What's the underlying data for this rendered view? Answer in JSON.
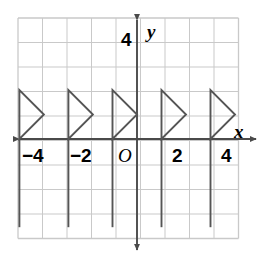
{
  "figure": {
    "type": "coordinate-grid-graph",
    "background": "#ffffff",
    "width": 265,
    "height": 271
  },
  "colors": {
    "grid_line": "#c9c9c9",
    "axis_line": "#4a4a4a",
    "shape_stroke": "#555555",
    "text": "#000000"
  },
  "grid": {
    "x_start_px": 18,
    "y_start_px": 18,
    "cell_px": 24.5,
    "cols": 9,
    "rows": 9,
    "visible": true
  },
  "axes": {
    "origin_px": {
      "x": 137,
      "y": 139
    },
    "unit_px": 24.5,
    "x_axis": {
      "label": "x",
      "label_pos_px": {
        "x": 234,
        "y": 122
      },
      "arrow_both_ends": true,
      "x_min_px": 19,
      "x_max_px": 256
    },
    "y_axis": {
      "label": "y",
      "label_pos_px": {
        "x": 147,
        "y": 22
      },
      "arrow_both_ends": true,
      "y_min_px": 20,
      "y_max_px": 250
    }
  },
  "tick_labels": [
    {
      "text": "−4",
      "axis": "x",
      "value": -4,
      "x_px": 22,
      "y_px": 146
    },
    {
      "text": "−2",
      "axis": "x",
      "value": -2,
      "x_px": 70,
      "y_px": 146
    },
    {
      "text": "O",
      "axis": "origin",
      "value": 0,
      "x_px": 118,
      "y_px": 146
    },
    {
      "text": "2",
      "axis": "x",
      "value": 2,
      "x_px": 172,
      "y_px": 146
    },
    {
      "text": "4",
      "axis": "x",
      "value": 4,
      "x_px": 221,
      "y_px": 146
    },
    {
      "text": "4",
      "axis": "y",
      "value": 4,
      "x_px": 121,
      "y_px": 30
    }
  ],
  "chart_data": {
    "type": "line",
    "title": "",
    "xlabel": "x",
    "ylabel": "y",
    "xlim": [
      -4.85,
      4.85
    ],
    "ylim": [
      -4.1,
      4.9
    ],
    "grid": true,
    "legend": null,
    "series": [
      {
        "name": "triangle-1",
        "vertices": [
          [
            -4.8,
            2
          ],
          [
            -4.8,
            0
          ],
          [
            -3.8,
            1
          ]
        ],
        "closed": true
      },
      {
        "name": "triangle-2",
        "vertices": [
          [
            -2.8,
            2
          ],
          [
            -2.8,
            0
          ],
          [
            -1.8,
            1
          ]
        ],
        "closed": true
      },
      {
        "name": "triangle-3",
        "vertices": [
          [
            -1.0,
            2
          ],
          [
            -1.0,
            0
          ],
          [
            0.0,
            1
          ]
        ],
        "closed": true
      },
      {
        "name": "triangle-4",
        "vertices": [
          [
            1.0,
            2
          ],
          [
            1.0,
            0
          ],
          [
            2.0,
            1
          ]
        ],
        "closed": true
      },
      {
        "name": "triangle-5",
        "vertices": [
          [
            3.0,
            2
          ],
          [
            3.0,
            0
          ],
          [
            4.0,
            1
          ]
        ],
        "closed": true
      }
    ],
    "vertical_extensions": [
      {
        "name": "extension-1",
        "x": -4.8,
        "y_from": 0,
        "y_to": -3.6
      },
      {
        "name": "extension-2",
        "x": -2.8,
        "y_from": 0,
        "y_to": -3.6
      },
      {
        "name": "extension-3",
        "x": -1.0,
        "y_from": 0,
        "y_to": -3.6
      },
      {
        "name": "extension-4",
        "x": 1.0,
        "y_from": 0,
        "y_to": -3.6
      },
      {
        "name": "extension-5",
        "x": 3.0,
        "y_from": 0,
        "y_to": -3.6
      }
    ]
  }
}
